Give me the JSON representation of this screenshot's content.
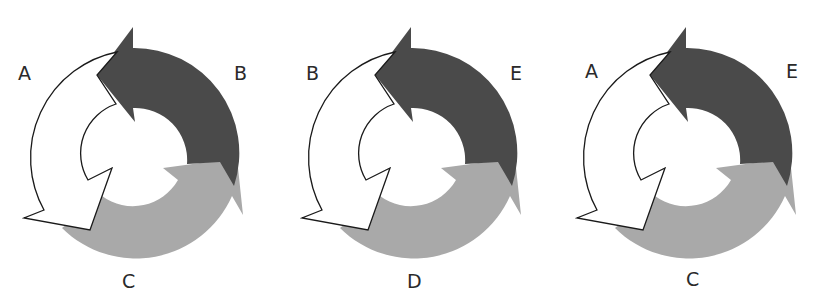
{
  "colors": {
    "dark_arrow": "#4a4a4a",
    "gray_arrow": "#a9a9a9",
    "white_arrow_fill": "#ffffff",
    "white_arrow_stroke": "#1a1a1a",
    "label": "#2a2a2a"
  },
  "panels": [
    {
      "labels": {
        "left": "A",
        "right": "B",
        "bottom": "C"
      }
    },
    {
      "labels": {
        "left": "B",
        "right": "E",
        "bottom": "D"
      }
    },
    {
      "labels": {
        "left": "A",
        "right": "E",
        "bottom": "C"
      }
    }
  ]
}
